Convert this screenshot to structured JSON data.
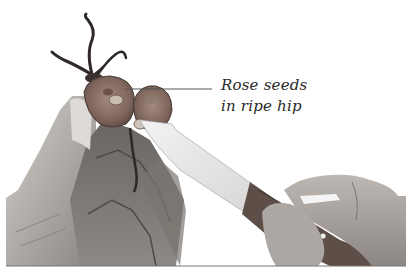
{
  "figure": {
    "annotation": {
      "line1": "Rose seeds",
      "line2": "in ripe hip"
    },
    "colors": {
      "background": "#ffffff",
      "skin_light": "#c8c4c0",
      "skin_mid": "#9a9590",
      "skin_dark": "#5e5a56",
      "hip_flesh": "#8a7268",
      "hip_dark": "#4e3c36",
      "knife_blade": "#e6e6e6",
      "knife_handle": "#5a4a44",
      "leader_line": "#555555"
    }
  }
}
